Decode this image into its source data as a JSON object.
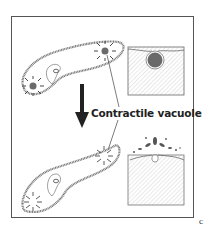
{
  "diagram": {
    "label": "Contractile vacuole",
    "panel_letter": "c",
    "states": [
      {
        "name": "filled",
        "description": "Paramecium with contractile vacuoles filled; inset shows vacuole full beneath membrane"
      },
      {
        "name": "expelled",
        "description": "Paramecium with contractile vacuoles contracted; inset shows water expelled through pore"
      }
    ],
    "colors": {
      "vacuole": "#6a6a6a",
      "outline": "#555555",
      "hatch": "#cccccc",
      "arrow": "#222222"
    }
  }
}
